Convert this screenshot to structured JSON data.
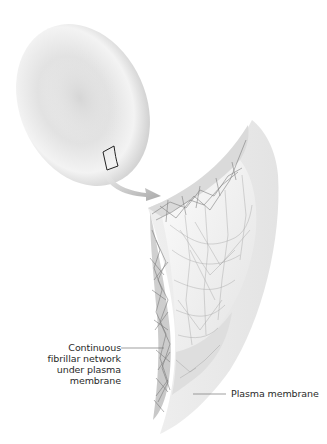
{
  "figure": {
    "elements": {
      "cell": "red-blood-cell",
      "inset_box": "selected-membrane-region",
      "arrow": "magnify-arrow",
      "sheet": "membrane-sheet-with-fibrillar-network"
    }
  },
  "labels": {
    "network": {
      "lines": [
        "Continuous",
        "fibrillar network",
        "under plasma",
        "membrane"
      ]
    },
    "membrane": {
      "text": "Plasma membrane"
    }
  },
  "colors": {
    "cell_light": "#f2f2f2",
    "cell_mid": "#d8d8d8",
    "cell_dark": "#bdbdbd",
    "sheet_light": "#f5f5f5",
    "sheet_mid": "#dcdcdc",
    "fiber": "#6a6a6a",
    "leader": "#777777",
    "text": "#2a2a2a"
  }
}
